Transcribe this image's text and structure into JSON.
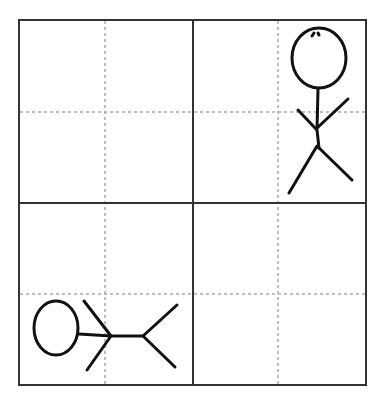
{
  "diagram": {
    "grid": {
      "outer": {
        "x1": 19,
        "y1": 20,
        "x2": 366,
        "y2": 385
      },
      "center": {
        "x": 193,
        "y": 203
      },
      "dashed_x": [
        105,
        278
      ],
      "dashed_y": [
        112,
        294
      ],
      "line_color": "#333333",
      "dash_color": "#aaaaaa"
    },
    "figures": [
      {
        "name": "standing-stick-figure",
        "cell": "top-right",
        "orientation": "upright"
      },
      {
        "name": "lying-stick-figure",
        "cell": "bottom-left",
        "orientation": "horizontal"
      }
    ]
  }
}
